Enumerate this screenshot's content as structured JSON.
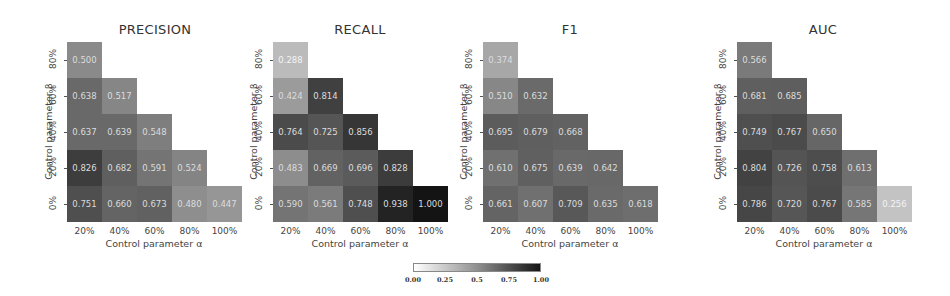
{
  "chart_data": [
    {
      "type": "heatmap",
      "title": "PRECISION",
      "xlabel": "Control parameter α",
      "ylabel": "Control parameter β",
      "x_categories": [
        "20%",
        "40%",
        "60%",
        "80%",
        "100%"
      ],
      "y_categories": [
        "80%",
        "60%",
        "40%",
        "20%",
        "0%"
      ],
      "rows": [
        [
          0.5
        ],
        [
          0.638,
          0.517
        ],
        [
          0.637,
          0.639,
          0.548
        ],
        [
          0.826,
          0.682,
          0.591,
          0.524
        ],
        [
          0.751,
          0.66,
          0.673,
          0.48,
          0.447
        ]
      ],
      "vmin": 0,
      "vmax": 1
    },
    {
      "type": "heatmap",
      "title": "RECALL",
      "xlabel": "Control parameter α",
      "ylabel": "Control parameter β",
      "x_categories": [
        "20%",
        "40%",
        "60%",
        "80%",
        "100%"
      ],
      "y_categories": [
        "80%",
        "60%",
        "40%",
        "20%",
        "0%"
      ],
      "rows": [
        [
          0.288
        ],
        [
          0.424,
          0.814
        ],
        [
          0.764,
          0.725,
          0.856
        ],
        [
          0.483,
          0.669,
          0.696,
          0.828
        ],
        [
          0.59,
          0.561,
          0.748,
          0.938,
          1.0
        ]
      ],
      "vmin": 0,
      "vmax": 1
    },
    {
      "type": "heatmap",
      "title": "F1",
      "xlabel": "Control parameter α",
      "ylabel": "Control parameter β",
      "x_categories": [
        "20%",
        "40%",
        "60%",
        "80%",
        "100%"
      ],
      "y_categories": [
        "80%",
        "60%",
        "40%",
        "20%",
        "0%"
      ],
      "rows": [
        [
          0.374
        ],
        [
          0.51,
          0.632
        ],
        [
          0.695,
          0.679,
          0.668
        ],
        [
          0.61,
          0.675,
          0.639,
          0.642
        ],
        [
          0.661,
          0.607,
          0.709,
          0.635,
          0.618
        ]
      ],
      "vmin": 0,
      "vmax": 1
    },
    {
      "type": "heatmap",
      "title": "AUC",
      "xlabel": "Control parameter α",
      "ylabel": "Control parameter β",
      "x_categories": [
        "20%",
        "40%",
        "60%",
        "80%",
        "100%"
      ],
      "y_categories": [
        "80%",
        "60%",
        "40%",
        "20%",
        "0%"
      ],
      "rows": [
        [
          0.566
        ],
        [
          0.681,
          0.685
        ],
        [
          0.749,
          0.767,
          0.65
        ],
        [
          0.804,
          0.726,
          0.758,
          0.613
        ],
        [
          0.786,
          0.72,
          0.767,
          0.585,
          0.256
        ]
      ],
      "vmin": 0,
      "vmax": 1
    }
  ],
  "colorbar": {
    "ticks": [
      "0.00",
      "0.25",
      "0.5",
      "0.75",
      "1.00"
    ],
    "colormap": "greys",
    "low_color": "#ffffff",
    "high_color": "#141414"
  },
  "layout": {
    "grid_left": [
      67,
      273,
      483,
      737
    ],
    "title_center": [
      155,
      360,
      570,
      823
    ],
    "ylabel_x": [
      48,
      253,
      463,
      717
    ],
    "ytick_x": [
      53,
      259,
      469,
      723
    ]
  }
}
